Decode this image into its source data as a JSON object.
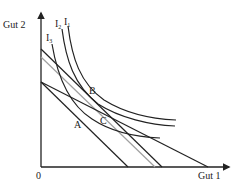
{
  "axes": {
    "y_label": "Gut 2",
    "x_label": "Gut 1",
    "origin_label": "0"
  },
  "curves": {
    "labels": [
      "I3",
      "I2",
      "I1"
    ],
    "I3": {
      "main": "I",
      "sub": "3"
    },
    "I2": {
      "main": "I",
      "sub": "2"
    },
    "I1": {
      "main": "I",
      "sub": "1"
    }
  },
  "points": {
    "A": "A",
    "B": "B",
    "C": "C"
  },
  "colors": {
    "line": "#222222",
    "gray_line": "#a0a0a0",
    "background": "#ffffff"
  }
}
